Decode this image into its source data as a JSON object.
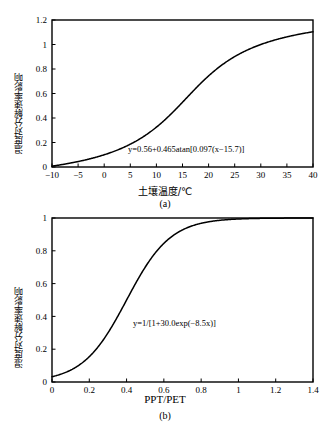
{
  "figure_a": {
    "caption": "(a)",
    "ylabel": "温度对分解速率影响",
    "xlabel": "土壤温度/℃",
    "equation": "y=0.56+0.465atan[0.097(x−15.7)]",
    "chart_data": {
      "type": "line",
      "title": "",
      "xlabel": "土壤温度/℃",
      "ylabel": "温度对分解速率影响",
      "xlim": [
        -10,
        40
      ],
      "ylim": [
        0,
        1.2
      ],
      "xticks": [
        "−10",
        "−5",
        "0",
        "5",
        "10",
        "15",
        "20",
        "25",
        "30",
        "35",
        "40"
      ],
      "xtick_values": [
        -10,
        -5,
        0,
        5,
        10,
        15,
        20,
        25,
        30,
        35,
        40
      ],
      "yticks": [
        "0",
        "0.2",
        "0.4",
        "0.6",
        "0.8",
        "1",
        "1.2"
      ],
      "ytick_values": [
        0,
        0.2,
        0.4,
        0.6,
        0.8,
        1,
        1.2
      ],
      "grid": false,
      "legend": "none",
      "annotation": "y=0.56+0.465atan[0.097(x−15.7)]",
      "series": [
        {
          "name": "温度响应函数",
          "formula": "y=0.56+0.465*atan(0.097*(x-15.7))",
          "color": "#000000",
          "x": [
            -10,
            -8,
            -6,
            -4,
            -2,
            0,
            2,
            4,
            6,
            8,
            10,
            12,
            14,
            16,
            18,
            20,
            22,
            24,
            26,
            28,
            30,
            32,
            34,
            36,
            38,
            40
          ],
          "y": [
            0.02,
            0.05,
            0.08,
            0.11,
            0.15,
            0.18,
            0.22,
            0.26,
            0.3,
            0.35,
            0.4,
            0.45,
            0.52,
            0.59,
            0.66,
            0.73,
            0.79,
            0.85,
            0.9,
            0.94,
            0.98,
            1.01,
            1.04,
            1.07,
            1.09,
            1.11
          ]
        }
      ]
    }
  },
  "figure_b": {
    "caption": "(b)",
    "ylabel": "湿度对分解速率影响",
    "xlabel": "PPT/PET",
    "equation": "y=1/[1+30.0exp(−8.5x)]",
    "chart_data": {
      "type": "line",
      "title": "",
      "xlabel": "PPT/PET",
      "ylabel": "湿度对分解速率影响",
      "xlim": [
        0,
        1.4
      ],
      "ylim": [
        0,
        1
      ],
      "xticks": [
        "0",
        "0.2",
        "0.4",
        "0.6",
        "0.8",
        "1",
        "1.2",
        "1.4"
      ],
      "xtick_values": [
        0,
        0.2,
        0.4,
        0.6,
        0.8,
        1,
        1.2,
        1.4
      ],
      "yticks": [
        "0",
        "0.2",
        "0.4",
        "0.6",
        "0.8",
        "1"
      ],
      "ytick_values": [
        0,
        0.2,
        0.4,
        0.6,
        0.8,
        1
      ],
      "grid": false,
      "legend": "none",
      "annotation": "y=1/[1+30.0exp(−8.5x)]",
      "series": [
        {
          "name": "湿度响应函数",
          "formula": "y=1/(1+30.0*exp(-8.5*x))",
          "color": "#000000",
          "x": [
            0,
            0.1,
            0.2,
            0.3,
            0.4,
            0.5,
            0.6,
            0.7,
            0.8,
            0.9,
            1.0,
            1.1,
            1.2,
            1.3,
            1.4
          ],
          "y": [
            0.032,
            0.073,
            0.154,
            0.296,
            0.494,
            0.694,
            0.838,
            0.92,
            0.962,
            0.983,
            0.993,
            0.997,
            0.999,
            0.999,
            1.0
          ]
        }
      ]
    }
  }
}
